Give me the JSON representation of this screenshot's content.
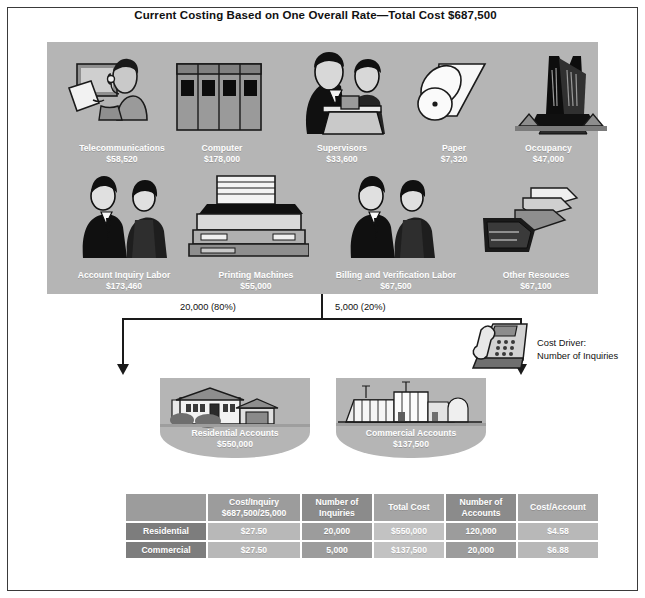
{
  "title": "Current Costing Based on One Overall Rate—Total Cost $687,500",
  "resource_pool": {
    "resources": [
      {
        "name": "Telecommunications",
        "amount": "$58,520",
        "icon": "headset-operator-icon"
      },
      {
        "name": "Computer",
        "amount": "$178,000",
        "icon": "server-rack-icon"
      },
      {
        "name": "Supervisors",
        "amount": "$33,600",
        "icon": "supervisors-icon"
      },
      {
        "name": "Paper",
        "amount": "$7,320",
        "icon": "paper-roll-icon"
      },
      {
        "name": "Occupancy",
        "amount": "$47,000",
        "icon": "office-building-icon"
      },
      {
        "name": "Account Inquiry Labor",
        "amount": "$173,460",
        "icon": "two-people-icon"
      },
      {
        "name": "Printing Machines",
        "amount": "$55,000",
        "icon": "printer-icon"
      },
      {
        "name": "Billing and Verification Labor",
        "amount": "$67,500",
        "icon": "two-people-icon"
      },
      {
        "name": "Other Resouces",
        "amount": "$67,100",
        "icon": "folders-icon"
      }
    ]
  },
  "flow": {
    "left_label": "20,000 (80%)",
    "right_label": "5,000 (20%)",
    "driver_line1": "Cost Driver:",
    "driver_line2": "Number of Inquiries",
    "driver_icon": "telephone-icon"
  },
  "cost_objects": [
    {
      "name": "Residential Accounts",
      "amount": "$550,000",
      "icon": "house-icon"
    },
    {
      "name": "Commercial Accounts",
      "amount": "$137,500",
      "icon": "factory-icon"
    }
  ],
  "table": {
    "headers": [
      "",
      "Cost/Inquiry $687,500/25,000",
      "Number of Inquiries",
      "Total Cost",
      "Number of Accounts",
      "Cost/Account"
    ],
    "headers_split": [
      {
        "l1": "",
        "l2": ""
      },
      {
        "l1": "Cost/Inquiry",
        "l2": "$687,500/25,000"
      },
      {
        "l1": "Number of",
        "l2": "Inquiries"
      },
      {
        "l1": "",
        "l2": "Total Cost"
      },
      {
        "l1": "Number of",
        "l2": "Accounts"
      },
      {
        "l1": "",
        "l2": "Cost/Account"
      }
    ],
    "rows": [
      {
        "label": "Residential",
        "cells": [
          "$27.50",
          "20,000",
          "$550,000",
          "120,000",
          "$4.58"
        ]
      },
      {
        "label": "Commercial",
        "cells": [
          "$27.50",
          "5,000",
          "$137,500",
          "20,000",
          "$6.88"
        ]
      }
    ]
  },
  "colors": {
    "pool_gray": "#b5b5b5",
    "label_white": "#ffffff",
    "line_black": "#1a1a1a",
    "table_header": "#9c9c9c"
  }
}
